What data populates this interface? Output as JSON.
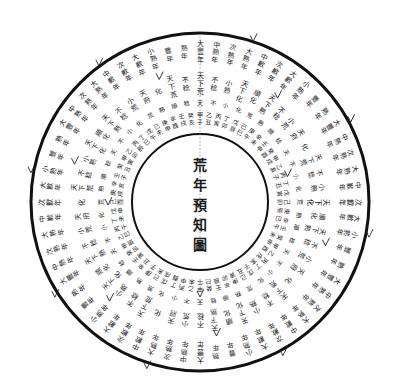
{
  "diagram": {
    "title": "荒年預知圖",
    "title_chars": [
      "荒",
      "年",
      "預",
      "知",
      "圖"
    ],
    "center": {
      "x": 200,
      "y": 202
    },
    "outer_radius": 170,
    "inner_radius": 68,
    "colors": {
      "ink": "#1a1a1a",
      "paper": "#ffffff"
    },
    "rings": [
      {
        "name": "outer-ring-harvest-grades",
        "radius": 150,
        "count": 60,
        "font_size": 7,
        "labels": [
          "大豐年",
          "中熟年",
          "次熟年",
          "大熟年",
          "中歉年",
          "次歉年",
          "大歉年",
          "小熟年",
          "豐年",
          "熟年"
        ]
      },
      {
        "name": "middle-ring-outer",
        "radius": 118,
        "count": 52,
        "font_size": 7,
        "labels": [
          "天下荒",
          "不稔",
          "小熟",
          "天下化",
          "順化",
          "天下熟",
          "不稔",
          "小荒",
          "天府",
          "化"
        ]
      },
      {
        "name": "middle-ring-inner",
        "radius": 100,
        "count": 48,
        "font_size": 6,
        "labels": [
          "天",
          "不",
          "小",
          "化",
          "荒",
          "熟",
          "順",
          "稔"
        ]
      },
      {
        "name": "stems-branches-ring-outer",
        "radius": 84,
        "count": 60,
        "font_size": 6,
        "labels": [
          "甲子",
          "乙丑",
          "丙寅",
          "丁卯",
          "戊辰",
          "己巳",
          "庚午",
          "辛未",
          "壬申",
          "癸酉",
          "甲戌",
          "乙亥",
          "丙子",
          "丁丑",
          "戊寅",
          "己卯",
          "庚辰",
          "辛巳",
          "壬午",
          "癸未",
          "甲申",
          "乙酉",
          "丙戌",
          "丁亥",
          "戊子",
          "己丑",
          "庚寅",
          "辛卯",
          "壬辰",
          "癸巳",
          "甲午",
          "乙未",
          "丙申",
          "丁酉",
          "戊戌",
          "己亥",
          "庚子",
          "辛丑",
          "壬寅",
          "癸卯",
          "甲辰",
          "乙巳",
          "丙午",
          "丁未",
          "戊申",
          "己酉",
          "庚戌",
          "辛亥",
          "壬子",
          "癸丑",
          "甲寅",
          "乙卯",
          "丙辰",
          "丁巳",
          "戊午",
          "己未",
          "庚申",
          "辛酉",
          "壬戌",
          "癸亥"
        ]
      }
    ]
  }
}
